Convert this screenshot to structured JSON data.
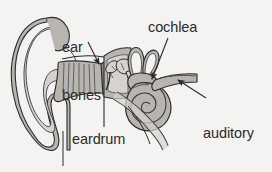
{
  "figure": {
    "name": "ear-anatomy-diagram",
    "background_color": "#f4f3f1",
    "outline_color": "#2b2b2b",
    "tissue_fill_color": "#b8b5b0",
    "tissue_light_fill_color": "#d6d3ce",
    "label_text_color": "#2b2b2b",
    "leader_line_color": "#2b2b2b"
  },
  "labels": {
    "ear_bones": "ear\nbones",
    "ear_bones_line1": "ear",
    "ear_bones_line2": "bones",
    "cochlea": "cochlea",
    "auditory_nerve": "auditory\nnerve",
    "auditory_nerve_line1": "auditory",
    "auditory_nerve_line2": "nerve",
    "eardrum": "eardrum"
  },
  "parts": [
    {
      "id": "pinna",
      "label": "outer ear (pinna)"
    },
    {
      "id": "ear-canal",
      "label": "ear canal"
    },
    {
      "id": "eardrum",
      "label": "eardrum"
    },
    {
      "id": "ear-bones",
      "label": "ear bones"
    },
    {
      "id": "semicircular-canals",
      "label": "semicircular canals"
    },
    {
      "id": "cochlea",
      "label": "cochlea"
    },
    {
      "id": "auditory-nerve",
      "label": "auditory nerve"
    },
    {
      "id": "eustachian-tube",
      "label": "eustachian tube"
    }
  ],
  "leaders": [
    {
      "id": "ear-bones-leader",
      "from_label": "ear bones",
      "to_part": "ear-bones",
      "arrow": true
    },
    {
      "id": "cochlea-leader",
      "from_label": "cochlea",
      "to_part": "cochlea",
      "arrow": true
    },
    {
      "id": "auditory-nerve-leader",
      "from_label": "auditory nerve",
      "to_part": "auditory-nerve",
      "arrow": true
    },
    {
      "id": "eardrum-leader",
      "from_label": "eardrum",
      "to_part": "eardrum",
      "arrow": false
    },
    {
      "id": "pinna-leader",
      "from_label": "",
      "to_part": "pinna",
      "arrow": false
    }
  ]
}
